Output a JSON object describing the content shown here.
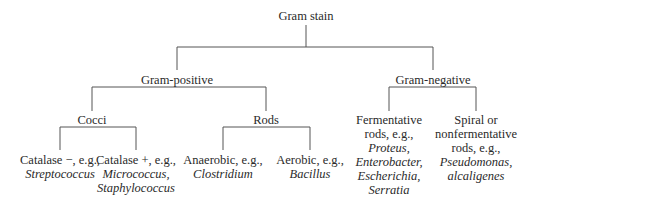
{
  "diagram": {
    "type": "tree",
    "title": "Gram stain",
    "line_color": "#555555",
    "root": {
      "label": "Gram stain"
    },
    "level1": {
      "positive": {
        "label": "Gram-positive"
      },
      "negative": {
        "label": "Gram-negative"
      }
    },
    "level2": {
      "cocci": {
        "label": "Cocci"
      },
      "rods": {
        "label": "Rods"
      },
      "fermentative": {
        "label_lines": [
          "Fermentative",
          "rods, e.g.,"
        ],
        "examples": [
          "Proteus,",
          "Enterobacter,",
          "Escherichia,",
          "Serratia"
        ]
      },
      "spiral": {
        "label_lines": [
          "Spiral or",
          "nonfermentative",
          "rods, e.g.,"
        ],
        "examples": [
          "Pseudomonas,",
          "alcaligenes"
        ]
      }
    },
    "level3": {
      "catalase_neg": {
        "label": "Catalase −, e.g.,",
        "examples": [
          "Streptococcus"
        ]
      },
      "catalase_pos": {
        "label": "Catalase +, e.g.,",
        "examples": [
          "Micrococcus,",
          "Staphylococcus"
        ]
      },
      "anaerobic": {
        "label": "Anaerobic, e.g.,",
        "examples": [
          "Clostridium"
        ]
      },
      "aerobic": {
        "label": "Aerobic, e.g.,",
        "examples": [
          "Bacillus"
        ]
      }
    }
  }
}
